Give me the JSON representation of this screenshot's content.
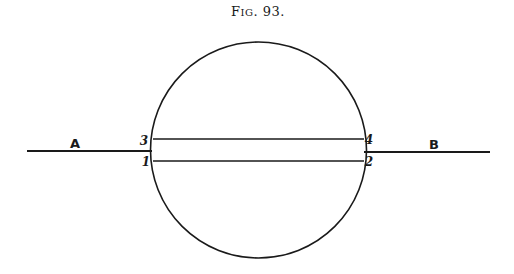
{
  "figure": {
    "caption": "Fig. 93.",
    "caption_parts": {
      "prefix": "F",
      "small_caps": "IG",
      "suffix": ". 93."
    },
    "labels": {
      "left_line": "A",
      "right_line": "B",
      "upper_left": "3",
      "upper_right": "4",
      "lower_left": "1",
      "lower_right": "2"
    },
    "colors": {
      "ink": "#1a1a1a",
      "background": "#ffffff"
    }
  }
}
